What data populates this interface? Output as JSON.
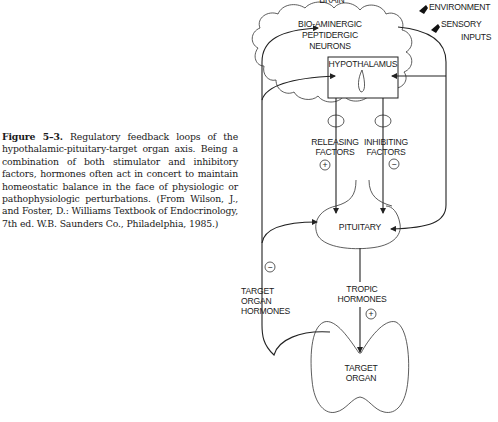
{
  "caption": {
    "figure_label": "Figure 5–3.",
    "text": " Regulatory feedback loops of the hypothalamic-pituitary-target organ axis. Being a combination of both stimulator and inhibitory factors, hormones often act in concert to maintain homeostatic balance in the face of physiologic or pathophysiologic perturbations. (From Wilson, J., and Foster, D.: Williams Textbook of Endocrinology, 7th ed. W.B. Saunders Co., Philadelphia, 1985.)"
  },
  "diagram": {
    "brain_label": "BRAIN",
    "neurons_label": [
      "BIO-AMINERGIC",
      "PEPTIDERGIC",
      "NEURONS"
    ],
    "hypothalamus_label": "HYPOTHALAMUS",
    "environment_label": "ENVIRONMENT",
    "sensory_label": [
      "SENSORY",
      "INPUTS"
    ],
    "releasing_label": [
      "RELEASING",
      "FACTORS"
    ],
    "inhibiting_label": [
      "INHIBITING",
      "FACTORS"
    ],
    "releasing_sign": "+",
    "inhibiting_sign": "−",
    "pituitary_label": "PITUITARY",
    "tropic_label": [
      "TROPIC",
      "HORMONES"
    ],
    "tropic_sign": "+",
    "target_hormones_label": [
      "TARGET",
      "ORGAN",
      "HORMONES"
    ],
    "target_hormones_sign": "−",
    "target_organ_label": [
      "TARGET",
      "ORGAN"
    ]
  }
}
